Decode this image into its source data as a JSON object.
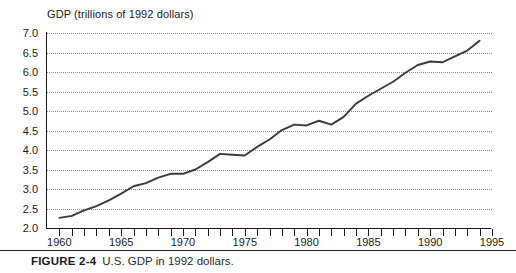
{
  "figure": {
    "caption_label": "FIGURE 2-4",
    "caption_text": "U.S. GDP in 1992 dollars.",
    "title": "GDP (trillions of 1992 dollars)"
  },
  "style": {
    "line_color": "#3a3a3a",
    "grid_color": "#8a8a8a",
    "axis_color": "#161616",
    "background": "#ffffff"
  },
  "chart_data": {
    "type": "line",
    "title": "GDP (trillions of 1992 dollars)",
    "xlabel": "",
    "ylabel": "GDP (trillions of 1992 dollars)",
    "xlim": [
      1959,
      1995
    ],
    "ylim": [
      2.0,
      7.0
    ],
    "grid": true,
    "legend": "none",
    "y_ticks": [
      2.0,
      2.5,
      3.0,
      3.5,
      4.0,
      4.5,
      5.0,
      5.5,
      6.0,
      6.5,
      7.0
    ],
    "y_tick_labels": [
      "2.0",
      "2.5",
      "3.0",
      "3.5",
      "4.0",
      "4.5",
      "5.0",
      "5.5",
      "6.0",
      "6.5",
      "7.0"
    ],
    "x_ticks": [
      1960,
      1961,
      1962,
      1963,
      1964,
      1965,
      1966,
      1967,
      1968,
      1969,
      1970,
      1971,
      1972,
      1973,
      1974,
      1975,
      1976,
      1977,
      1978,
      1979,
      1980,
      1981,
      1982,
      1983,
      1984,
      1985,
      1986,
      1987,
      1988,
      1989,
      1990,
      1991,
      1992,
      1993,
      1994,
      1995
    ],
    "x_tick_labels_shown": [
      "1960",
      "1965",
      "1970",
      "1975",
      "1980",
      "1985",
      "1990",
      "1995"
    ],
    "x_tick_labels_shown_values": [
      1960,
      1965,
      1970,
      1975,
      1980,
      1985,
      1990,
      1995
    ],
    "series": [
      {
        "name": "U.S. GDP",
        "x": [
          1960,
          1961,
          1962,
          1963,
          1964,
          1965,
          1966,
          1967,
          1968,
          1969,
          1970,
          1971,
          1972,
          1973,
          1974,
          1975,
          1976,
          1977,
          1978,
          1979,
          1980,
          1981,
          1982,
          1983,
          1984,
          1985,
          1986,
          1987,
          1988,
          1989,
          1990,
          1991,
          1992,
          1993,
          1994
        ],
        "values": [
          2.26,
          2.31,
          2.45,
          2.56,
          2.71,
          2.88,
          3.07,
          3.15,
          3.29,
          3.39,
          3.39,
          3.5,
          3.69,
          3.9,
          3.88,
          3.86,
          4.08,
          4.27,
          4.51,
          4.65,
          4.63,
          4.75,
          4.65,
          4.85,
          5.19,
          5.39,
          5.57,
          5.75,
          5.98,
          6.18,
          6.27,
          6.25,
          6.4,
          6.55,
          6.8
        ]
      }
    ]
  }
}
